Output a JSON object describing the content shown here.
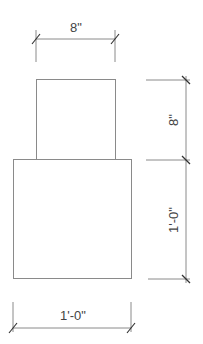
{
  "drawing": {
    "top_width_label": "8\"",
    "top_height_label": "8\"",
    "bottom_height_label": "1'-0\"",
    "bottom_width_label": "1'-0\""
  },
  "shapes": {
    "top_box": {
      "label": "upper block",
      "width_in": 8,
      "height_in": 8
    },
    "bottom_box": {
      "label": "lower block",
      "width_in": 12,
      "height_in": 12
    }
  },
  "colors": {
    "line": "#8a8a8a",
    "tick": "#333333",
    "text": "#444444",
    "background": "#ffffff"
  }
}
